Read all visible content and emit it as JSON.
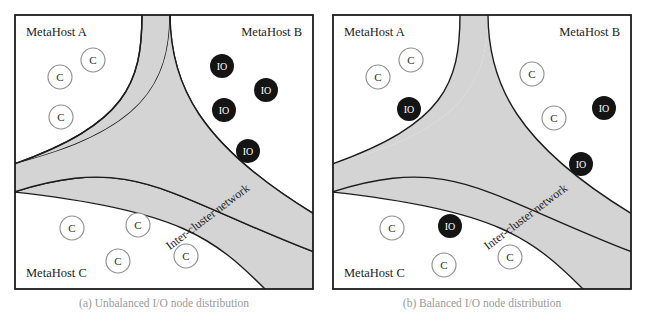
{
  "figure": {
    "panels": [
      {
        "id": "a",
        "caption": "(a) Unbalanced I/O node distribution",
        "frame_color": "#1c1c1c",
        "background": "#ffffff",
        "network_band": {
          "label": "Inter-cluster network",
          "fill": "#d4d4d4",
          "stroke": "#1c1c1c"
        },
        "regions": [
          {
            "name": "MetaHost A",
            "label": "MetaHost A",
            "label_x": 12,
            "label_y": 22,
            "label_anchor": "start",
            "nodes": [
              {
                "type": "C",
                "label": "C",
                "x": 46,
                "y": 63,
                "r": 12
              },
              {
                "type": "C",
                "label": "C",
                "x": 79,
                "y": 46,
                "r": 12
              },
              {
                "type": "C",
                "label": "C",
                "x": 47,
                "y": 103,
                "r": 12
              }
            ]
          },
          {
            "name": "MetaHost B",
            "label": "MetaHost B",
            "label_x": 288,
            "label_y": 22,
            "label_anchor": "end",
            "nodes": [
              {
                "type": "IO",
                "label": "IO",
                "x": 208,
                "y": 52,
                "r": 12
              },
              {
                "type": "IO",
                "label": "IO",
                "x": 252,
                "y": 76,
                "r": 12
              },
              {
                "type": "IO",
                "label": "IO",
                "x": 210,
                "y": 96,
                "r": 12
              },
              {
                "type": "IO",
                "label": "IO",
                "x": 234,
                "y": 137,
                "r": 12
              }
            ]
          },
          {
            "name": "MetaHost C",
            "label": "MetaHost C",
            "label_x": 12,
            "label_y": 263,
            "label_anchor": "start",
            "nodes": [
              {
                "type": "C",
                "label": "C",
                "x": 58,
                "y": 214,
                "r": 12
              },
              {
                "type": "C",
                "label": "C",
                "x": 124,
                "y": 211,
                "r": 12
              },
              {
                "type": "C",
                "label": "C",
                "x": 104,
                "y": 247,
                "r": 12
              },
              {
                "type": "C",
                "label": "C",
                "x": 172,
                "y": 242,
                "r": 12
              }
            ]
          }
        ]
      },
      {
        "id": "b",
        "caption": "(b) Balanced I/O node distribution",
        "frame_color": "#1c1c1c",
        "background": "#ffffff",
        "network_band": {
          "label": "Inter-cluster network",
          "fill": "#d4d4d4",
          "stroke": "#1c1c1c"
        },
        "regions": [
          {
            "name": "MetaHost A",
            "label": "MetaHost A",
            "label_x": 12,
            "label_y": 22,
            "label_anchor": "start",
            "nodes": [
              {
                "type": "C",
                "label": "C",
                "x": 46,
                "y": 63,
                "r": 12
              },
              {
                "type": "C",
                "label": "C",
                "x": 79,
                "y": 46,
                "r": 12
              },
              {
                "type": "IO",
                "label": "IO",
                "x": 77,
                "y": 95,
                "r": 12
              }
            ]
          },
          {
            "name": "MetaHost B",
            "label": "MetaHost B",
            "label_x": 288,
            "label_y": 22,
            "label_anchor": "end",
            "nodes": [
              {
                "type": "C",
                "label": "C",
                "x": 200,
                "y": 60,
                "r": 12
              },
              {
                "type": "IO",
                "label": "IO",
                "x": 272,
                "y": 94,
                "r": 12
              },
              {
                "type": "C",
                "label": "C",
                "x": 222,
                "y": 104,
                "r": 12
              },
              {
                "type": "IO",
                "label": "IO",
                "x": 249,
                "y": 150,
                "r": 12
              }
            ]
          },
          {
            "name": "MetaHost C",
            "label": "MetaHost C",
            "label_x": 12,
            "label_y": 263,
            "label_anchor": "start",
            "nodes": [
              {
                "type": "C",
                "label": "C",
                "x": 60,
                "y": 214,
                "r": 12
              },
              {
                "type": "IO",
                "label": "IO",
                "x": 118,
                "y": 212,
                "r": 12
              },
              {
                "type": "C",
                "label": "C",
                "x": 112,
                "y": 251,
                "r": 12
              },
              {
                "type": "C",
                "label": "C",
                "x": 178,
                "y": 243,
                "r": 12
              }
            ]
          }
        ]
      }
    ],
    "legend": {
      "compute_node_symbol": "C",
      "io_node_symbol": "IO"
    },
    "colors": {
      "band_fill": "#d4d4d4",
      "io_node_fill": "#141414",
      "io_node_text": "#ffffff",
      "c_node_fill": "#ffffff",
      "c_node_stroke": "#8e8e8e",
      "c_node_text": "#2a2a2a",
      "frame": "#1c1c1c",
      "page_background": "#ffffff"
    }
  }
}
